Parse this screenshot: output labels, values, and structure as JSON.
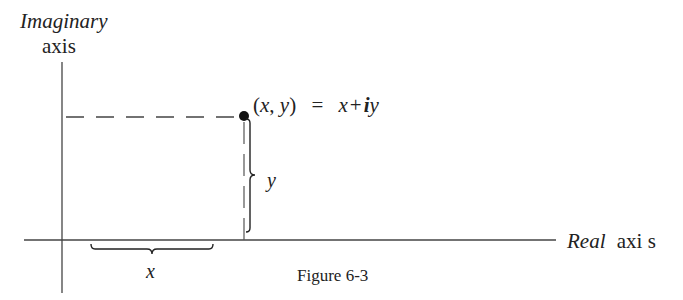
{
  "diagram": {
    "type": "complex-plane",
    "caption": "Figure 6-3",
    "vertical_axis": {
      "label_line1": "Imaginary",
      "label_line2": "axis"
    },
    "horizontal_axis": {
      "label_italic": "Real",
      "label_plain": "axi s"
    },
    "point": {
      "label_open": "(",
      "label_x": "x",
      "label_comma": ", ",
      "label_y": "y",
      "label_close": ")",
      "label_eq": "=",
      "label_x2": "x",
      "label_plus": "+",
      "label_i": "i",
      "label_y2": "y"
    },
    "x_brace_label": "x",
    "y_brace_label": "y",
    "colors": {
      "ink": "#222222",
      "axis": "#444444",
      "background": "#ffffff"
    }
  }
}
